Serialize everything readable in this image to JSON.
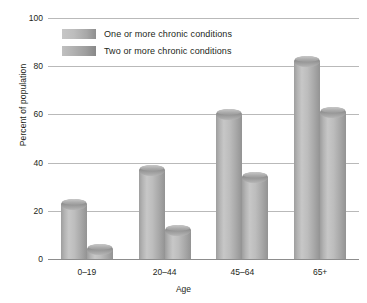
{
  "chart_data": {
    "type": "bar",
    "title": "",
    "xlabel": "Age",
    "ylabel": "Percent of population",
    "categories": [
      "0–19",
      "20–44",
      "45–64",
      "65+"
    ],
    "series": [
      {
        "name": "One or more chronic conditions",
        "values": [
          23,
          37,
          60,
          82
        ],
        "color": "#b4b4b4"
      },
      {
        "name": "Two or more chronic conditions",
        "values": [
          4,
          12,
          34,
          61
        ],
        "color": "#a8a8a8"
      }
    ],
    "ylim": [
      0,
      100
    ],
    "yticks": [
      0,
      20,
      40,
      60,
      80,
      100
    ],
    "ytick_labels": [
      "0",
      "20",
      "40",
      "60",
      "80",
      "100"
    ],
    "grid": true,
    "legend_position": "upper-left-inside"
  },
  "axes": {
    "y_title": "Percent of population",
    "x_title": "Age"
  },
  "legend": {
    "items": [
      {
        "label": "One or more chronic conditions"
      },
      {
        "label": "Two or more chronic conditions"
      }
    ]
  }
}
